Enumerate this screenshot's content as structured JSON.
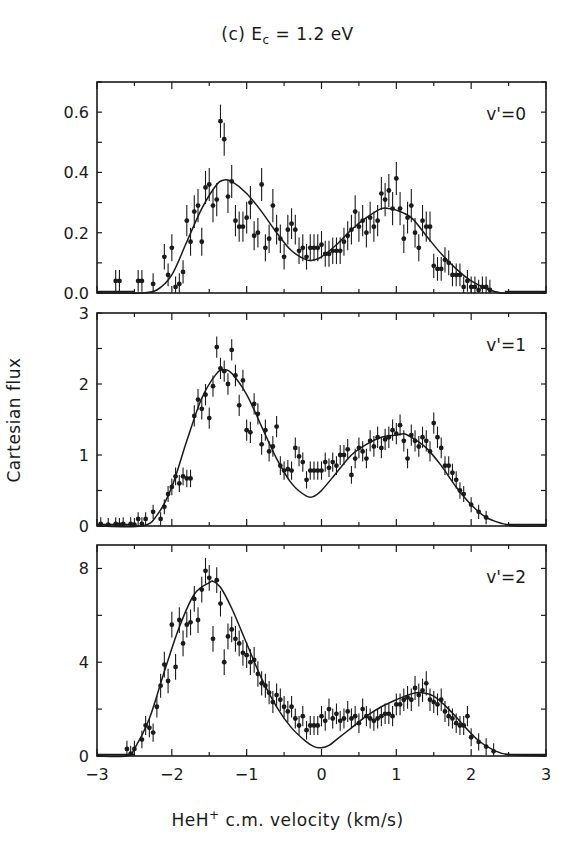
{
  "figure": {
    "title_prefix": "(c) E",
    "title_sub": "c",
    "title_suffix": " = 1.2 eV",
    "ylabel": "Cartesian flux",
    "xlabel_prefix": "HeH",
    "xlabel_sup": "+",
    "xlabel_suffix": " c.m. velocity (km/s)"
  },
  "chart_data": [
    {
      "type": "scatter",
      "panel": "top",
      "title": "(c) E_c = 1.2 eV",
      "annotation": "v'=0",
      "xlabel": "HeH+ c.m. velocity (km/s)",
      "ylabel": "Cartesian flux",
      "xlim": [
        -3,
        3
      ],
      "ylim": [
        0,
        0.7
      ],
      "xticks": [
        -3,
        -2,
        -1,
        0,
        1,
        2,
        3
      ],
      "yticks": [
        0.0,
        0.2,
        0.4,
        0.6
      ],
      "ytick_labels": [
        "0.0",
        "0.2",
        "0.4",
        "0.6"
      ],
      "grid": false,
      "series": [
        {
          "name": "data",
          "style": "points_with_errorbars",
          "x": [
            -2.75,
            -2.7,
            -2.45,
            -2.4,
            -2.25,
            -2.1,
            -2.05,
            -2.0,
            -1.95,
            -1.9,
            -1.85,
            -1.8,
            -1.75,
            -1.7,
            -1.65,
            -1.6,
            -1.55,
            -1.5,
            -1.45,
            -1.4,
            -1.35,
            -1.3,
            -1.25,
            -1.2,
            -1.15,
            -1.1,
            -1.05,
            -1.0,
            -0.95,
            -0.9,
            -0.85,
            -0.8,
            -0.75,
            -0.7,
            -0.65,
            -0.6,
            -0.55,
            -0.5,
            -0.45,
            -0.4,
            -0.35,
            -0.3,
            -0.25,
            -0.2,
            -0.15,
            -0.1,
            -0.05,
            0.0,
            0.05,
            0.1,
            0.15,
            0.2,
            0.25,
            0.3,
            0.35,
            0.4,
            0.45,
            0.5,
            0.55,
            0.6,
            0.65,
            0.7,
            0.75,
            0.8,
            0.85,
            0.9,
            0.95,
            1.0,
            1.05,
            1.1,
            1.15,
            1.2,
            1.25,
            1.3,
            1.35,
            1.4,
            1.45,
            1.5,
            1.55,
            1.6,
            1.65,
            1.7,
            1.75,
            1.8,
            1.85,
            1.9,
            1.95,
            2.0,
            2.05,
            2.1,
            2.15,
            2.2,
            2.25
          ],
          "y": [
            0.04,
            0.04,
            0.04,
            0.04,
            0.03,
            0.12,
            0.06,
            0.15,
            0.02,
            0.03,
            0.07,
            0.24,
            0.17,
            0.27,
            0.29,
            0.17,
            0.35,
            0.36,
            0.29,
            0.31,
            0.57,
            0.51,
            0.32,
            0.37,
            0.24,
            0.22,
            0.22,
            0.25,
            0.3,
            0.19,
            0.2,
            0.36,
            0.15,
            0.18,
            0.29,
            0.21,
            0.18,
            0.12,
            0.21,
            0.23,
            0.21,
            0.14,
            0.15,
            0.12,
            0.15,
            0.15,
            0.15,
            0.16,
            0.13,
            0.13,
            0.14,
            0.14,
            0.14,
            0.17,
            0.19,
            0.21,
            0.27,
            0.22,
            0.24,
            0.2,
            0.25,
            0.22,
            0.24,
            0.33,
            0.31,
            0.34,
            0.28,
            0.38,
            0.28,
            0.18,
            0.25,
            0.29,
            0.2,
            0.15,
            0.24,
            0.22,
            0.22,
            0.09,
            0.08,
            0.08,
            0.11,
            0.1,
            0.06,
            0.06,
            0.06,
            0.02,
            0.04,
            0.02,
            0.02,
            0.01,
            0.02,
            0.02,
            0.01
          ],
          "yerr": 0.055
        },
        {
          "name": "fit",
          "style": "line",
          "x": [
            -3.0,
            -2.6,
            -2.4,
            -2.2,
            -2.0,
            -1.8,
            -1.6,
            -1.4,
            -1.3,
            -1.2,
            -1.0,
            -0.8,
            -0.6,
            -0.4,
            -0.2,
            -0.1,
            0.0,
            0.2,
            0.4,
            0.6,
            0.8,
            0.9,
            1.0,
            1.2,
            1.4,
            1.6,
            1.8,
            2.0,
            2.2,
            2.4,
            2.6,
            3.0
          ],
          "y": [
            0.0,
            0.0,
            0.0,
            0.01,
            0.06,
            0.17,
            0.28,
            0.36,
            0.375,
            0.37,
            0.33,
            0.27,
            0.2,
            0.14,
            0.11,
            0.11,
            0.12,
            0.16,
            0.21,
            0.25,
            0.28,
            0.28,
            0.275,
            0.25,
            0.19,
            0.13,
            0.08,
            0.04,
            0.015,
            0.0,
            0.0,
            0.0
          ]
        }
      ]
    },
    {
      "type": "scatter",
      "panel": "middle",
      "annotation": "v'=1",
      "xlim": [
        -3,
        3
      ],
      "ylim": [
        0,
        3
      ],
      "xticks": [
        -3,
        -2,
        -1,
        0,
        1,
        2,
        3
      ],
      "yticks": [
        0,
        1,
        2,
        3
      ],
      "ytick_labels": [
        "0",
        "1",
        "2",
        "3"
      ],
      "grid": false,
      "series": [
        {
          "name": "data",
          "style": "points_with_errorbars",
          "x": [
            -2.95,
            -2.85,
            -2.75,
            -2.7,
            -2.65,
            -2.55,
            -2.5,
            -2.45,
            -2.4,
            -2.35,
            -2.25,
            -2.15,
            -2.1,
            -2.05,
            -2.0,
            -1.95,
            -1.9,
            -1.85,
            -1.8,
            -1.75,
            -1.7,
            -1.65,
            -1.6,
            -1.55,
            -1.5,
            -1.45,
            -1.4,
            -1.35,
            -1.3,
            -1.25,
            -1.2,
            -1.15,
            -1.1,
            -1.05,
            -1.0,
            -0.95,
            -0.9,
            -0.85,
            -0.8,
            -0.75,
            -0.7,
            -0.65,
            -0.6,
            -0.55,
            -0.5,
            -0.45,
            -0.4,
            -0.35,
            -0.3,
            -0.25,
            -0.2,
            -0.15,
            -0.1,
            -0.05,
            0.0,
            0.05,
            0.1,
            0.15,
            0.2,
            0.25,
            0.3,
            0.35,
            0.4,
            0.45,
            0.5,
            0.55,
            0.6,
            0.65,
            0.7,
            0.75,
            0.8,
            0.85,
            0.9,
            0.95,
            1.0,
            1.05,
            1.1,
            1.15,
            1.2,
            1.25,
            1.3,
            1.35,
            1.4,
            1.45,
            1.5,
            1.55,
            1.6,
            1.65,
            1.7,
            1.75,
            1.8,
            1.85,
            1.9,
            2.0,
            2.1,
            2.2
          ],
          "y": [
            0.03,
            0.02,
            0.03,
            0.02,
            0.03,
            0.03,
            0.02,
            0.1,
            0.03,
            0.1,
            0.2,
            0.1,
            0.27,
            0.45,
            0.55,
            0.7,
            0.6,
            0.7,
            0.67,
            0.67,
            1.55,
            1.78,
            1.65,
            1.85,
            1.52,
            1.97,
            2.52,
            2.22,
            2.18,
            2.0,
            2.48,
            2.12,
            1.7,
            2.05,
            1.35,
            1.32,
            1.72,
            1.58,
            1.15,
            1.35,
            1.05,
            1.12,
            1.4,
            0.85,
            0.78,
            0.8,
            0.78,
            1.1,
            0.98,
            0.9,
            0.65,
            0.78,
            0.78,
            0.78,
            0.78,
            0.9,
            0.82,
            0.9,
            0.85,
            1.0,
            1.0,
            1.08,
            0.72,
            0.95,
            1.1,
            1.05,
            0.95,
            1.2,
            1.12,
            1.25,
            1.1,
            1.22,
            1.25,
            1.35,
            1.3,
            1.42,
            1.2,
            0.95,
            1.28,
            1.2,
            1.12,
            1.25,
            1.2,
            1.05,
            1.45,
            1.25,
            1.1,
            0.85,
            0.85,
            0.75,
            0.65,
            0.5,
            0.45,
            0.3,
            0.2,
            0.12
          ],
          "yerr": 0.15
        },
        {
          "name": "fit",
          "style": "line",
          "x": [
            -3.0,
            -2.4,
            -2.2,
            -2.0,
            -1.8,
            -1.6,
            -1.4,
            -1.3,
            -1.2,
            -1.0,
            -0.8,
            -0.6,
            -0.4,
            -0.2,
            -0.1,
            0.0,
            0.2,
            0.4,
            0.6,
            0.8,
            1.0,
            1.1,
            1.2,
            1.4,
            1.6,
            1.8,
            2.0,
            2.2,
            2.4,
            2.6,
            3.0
          ],
          "y": [
            0.0,
            0.0,
            0.15,
            0.55,
            1.2,
            1.8,
            2.15,
            2.2,
            2.15,
            1.85,
            1.4,
            0.95,
            0.6,
            0.42,
            0.42,
            0.5,
            0.75,
            1.0,
            1.15,
            1.25,
            1.28,
            1.3,
            1.25,
            1.1,
            0.85,
            0.55,
            0.3,
            0.12,
            0.04,
            0.0,
            0.0
          ]
        }
      ]
    },
    {
      "type": "scatter",
      "panel": "bottom",
      "annotation": "v'=2",
      "xlim": [
        -3,
        3
      ],
      "ylim": [
        0,
        9
      ],
      "xticks": [
        -3,
        -2,
        -1,
        0,
        1,
        2,
        3
      ],
      "xtick_labels": [
        "−3",
        "−2",
        "−1",
        "0",
        "1",
        "2",
        "3"
      ],
      "yticks": [
        0,
        4,
        8
      ],
      "ytick_labels": [
        "0",
        "4",
        "8"
      ],
      "grid": false,
      "series": [
        {
          "name": "data",
          "style": "points_with_errorbars",
          "x": [
            -2.6,
            -2.55,
            -2.5,
            -2.4,
            -2.35,
            -2.3,
            -2.25,
            -2.2,
            -2.15,
            -2.1,
            -2.05,
            -2.0,
            -1.95,
            -1.9,
            -1.85,
            -1.8,
            -1.75,
            -1.7,
            -1.65,
            -1.6,
            -1.55,
            -1.5,
            -1.45,
            -1.4,
            -1.35,
            -1.3,
            -1.25,
            -1.2,
            -1.15,
            -1.1,
            -1.05,
            -1.0,
            -0.95,
            -0.9,
            -0.85,
            -0.8,
            -0.75,
            -0.7,
            -0.65,
            -0.6,
            -0.55,
            -0.5,
            -0.45,
            -0.4,
            -0.35,
            -0.3,
            -0.25,
            -0.2,
            -0.15,
            -0.1,
            -0.05,
            0.0,
            0.05,
            0.1,
            0.15,
            0.2,
            0.25,
            0.3,
            0.35,
            0.4,
            0.45,
            0.5,
            0.55,
            0.6,
            0.65,
            0.7,
            0.75,
            0.8,
            0.85,
            0.9,
            0.95,
            1.0,
            1.05,
            1.1,
            1.15,
            1.2,
            1.25,
            1.3,
            1.35,
            1.4,
            1.45,
            1.5,
            1.55,
            1.6,
            1.65,
            1.7,
            1.75,
            1.8,
            1.85,
            1.9,
            1.95,
            2.0,
            2.1,
            2.2,
            2.3
          ],
          "y": [
            0.3,
            0.1,
            0.3,
            0.7,
            1.3,
            1.2,
            1.0,
            2.1,
            3.0,
            3.9,
            3.2,
            5.6,
            3.8,
            5.8,
            4.8,
            5.6,
            5.7,
            6.7,
            5.8,
            7.1,
            7.9,
            7.6,
            5.0,
            7.5,
            6.5,
            4.0,
            5.1,
            5.4,
            5.0,
            4.8,
            4.4,
            4.3,
            4.0,
            4.1,
            3.5,
            3.1,
            3.0,
            2.7,
            2.3,
            2.6,
            2.4,
            2.1,
            1.9,
            2.1,
            1.6,
            1.3,
            1.7,
            1.1,
            1.3,
            1.3,
            1.3,
            1.7,
            1.5,
            2.0,
            1.6,
            1.8,
            1.5,
            1.6,
            1.9,
            1.6,
            1.7,
            1.4,
            2.0,
            1.7,
            1.6,
            1.5,
            1.6,
            1.7,
            1.8,
            1.8,
            1.7,
            2.2,
            2.2,
            2.4,
            2.5,
            2.4,
            2.9,
            2.6,
            2.8,
            3.1,
            2.4,
            2.3,
            2.2,
            2.4,
            1.9,
            1.7,
            1.6,
            1.4,
            1.3,
            1.3,
            1.7,
            0.8,
            0.6,
            0.4,
            0.2
          ],
          "yerr": 0.55
        },
        {
          "name": "fit",
          "style": "line",
          "x": [
            -3.0,
            -2.6,
            -2.5,
            -2.3,
            -2.1,
            -1.9,
            -1.7,
            -1.5,
            -1.45,
            -1.35,
            -1.2,
            -1.0,
            -0.8,
            -0.6,
            -0.4,
            -0.2,
            -0.1,
            0.0,
            0.1,
            0.2,
            0.4,
            0.6,
            0.8,
            1.0,
            1.2,
            1.35,
            1.5,
            1.7,
            1.9,
            2.1,
            2.3,
            2.5,
            3.0
          ],
          "y": [
            0.0,
            0.0,
            0.3,
            1.6,
            3.6,
            5.5,
            6.9,
            7.4,
            7.45,
            7.2,
            6.3,
            4.8,
            3.3,
            2.1,
            1.2,
            0.6,
            0.4,
            0.35,
            0.45,
            0.7,
            1.2,
            1.7,
            2.1,
            2.4,
            2.65,
            2.7,
            2.55,
            2.0,
            1.3,
            0.65,
            0.25,
            0.06,
            0.0
          ]
        }
      ]
    }
  ]
}
